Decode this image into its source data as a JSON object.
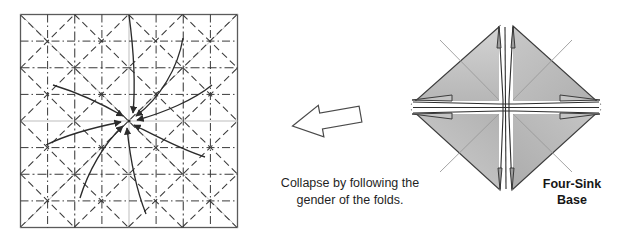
{
  "figure": {
    "domain_type": "origami-instruction-diagram",
    "background_color": "#ffffff"
  },
  "left_panel": {
    "name": "crease-pattern",
    "description": "Square crease pattern with grid, diagonals and eight spiral collapse arrows converging at center",
    "square": {
      "x": 20,
      "y": 14,
      "width": 218,
      "height": 214,
      "border_color": "#5a5a5a",
      "border_width": 1.3
    },
    "grid_divisions": 4,
    "line_styles": {
      "mountain_label": "mountain fold",
      "mountain_dash": "7,4",
      "mountain_color": "#3a3a3a",
      "valley_label": "valley fold",
      "valley_dash": "9,3,2,3",
      "valley_color": "#3a3a3a",
      "raw_edge_color": "#b8b8b8"
    },
    "arrow_count": 8,
    "arrow_color": "#2b2b2b"
  },
  "transition_arrow": {
    "name": "step-arrow",
    "direction": "right",
    "x": 292,
    "y": 100,
    "width": 70,
    "height": 40,
    "stroke_color": "#4a4a4a",
    "fill_color": "#ffffff"
  },
  "caption": {
    "line1": "Collapse by following the",
    "line2": "gender of the folds."
  },
  "right_panel": {
    "name": "four-sink-base",
    "description": "Completed four-sink base shown as a shaded diamond with a white cross of sunken creases at its center",
    "center_x": 506,
    "center_y": 107,
    "half_width": 94,
    "half_height": 85,
    "fill_color": "#bdbdbd",
    "fill_color_light": "#d2d2d2",
    "fill_color_dark": "#a9a9a9",
    "outline_color": "#3c3c3c",
    "crease_color": "#8e8e8e",
    "sink_line_color": "#2e2e2e"
  },
  "base_label": {
    "line1": "Four-Sink",
    "line2": "Base"
  }
}
